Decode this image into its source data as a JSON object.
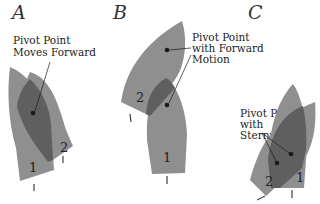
{
  "diagram": {
    "panels": [
      {
        "letter": "A",
        "caption_lines": [
          "Pivot Point",
          "Moves Forward"
        ],
        "boat_labels": [
          "1",
          "2"
        ]
      },
      {
        "letter": "B",
        "caption_lines": [
          "Pivot Point",
          "with Forward",
          "Motion"
        ],
        "boat_labels": [
          "1",
          "2"
        ]
      },
      {
        "letter": "C",
        "caption_lines": [
          "Pivot Point",
          "with",
          "Sternway"
        ],
        "boat_labels": [
          "1",
          "2"
        ]
      }
    ],
    "colors": {
      "hull": "#8f8f8f",
      "overlap": "#5f5f5f",
      "ink": "#1a1a1a",
      "background": "#ffffff"
    }
  }
}
